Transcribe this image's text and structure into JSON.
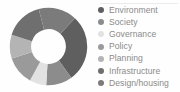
{
  "chart_data": {
    "type": "pie",
    "variant": "donut",
    "title": "",
    "xlabel": "",
    "ylabel": "",
    "grid": false,
    "legend_position": "right",
    "hole_ratio": 0.45,
    "start_angle_deg": -47,
    "direction": "clockwise",
    "categories": [
      "Environment",
      "Society",
      "Governance",
      "Policy",
      "Planning",
      "Infrastructure",
      "Design/housing"
    ],
    "values": [
      28,
      11,
      7,
      12,
      10,
      16,
      16
    ],
    "colors": [
      "#5f5f5f",
      "#8c8c8c",
      "#e2e2e2",
      "#9a9a9a",
      "#b4b4b4",
      "#6f6f6f",
      "#7b7b7b"
    ],
    "background_color": "#fefefe",
    "label_color": "#8a8a8a"
  },
  "legend": {
    "items": [
      {
        "label": "Environment",
        "color": "#5f5f5f"
      },
      {
        "label": "Society",
        "color": "#8c8c8c"
      },
      {
        "label": "Governance",
        "color": "#e2e2e2"
      },
      {
        "label": "Policy",
        "color": "#9a9a9a"
      },
      {
        "label": "Planning",
        "color": "#b4b4b4"
      },
      {
        "label": "Infrastructure",
        "color": "#6f6f6f"
      },
      {
        "label": "Design/housing",
        "color": "#7b7b7b"
      }
    ]
  }
}
